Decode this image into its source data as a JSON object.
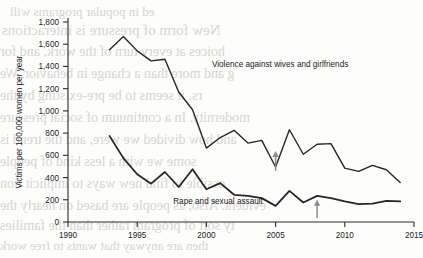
{
  "background_text": {
    "note": "faint show-through text from reverse of printed page",
    "lines": [
      {
        "text": "ed in popular programs will",
        "x": 10,
        "y": 4,
        "size": 13
      },
      {
        "text": "New form of pressure is interactions",
        "x": 2,
        "y": 22,
        "size": 15
      },
      {
        "text": "hoices at every turn of the work, and for",
        "x": 0,
        "y": 44,
        "size": 14
      },
      {
        "text": "g and more than a change in behavior. We",
        "x": 0,
        "y": 66,
        "size": 14
      },
      {
        "text": "rs, it seems to be pre-existing by the",
        "x": 0,
        "y": 88,
        "size": 14
      },
      {
        "text": "modernity. In a continuum of social pressure",
        "x": 0,
        "y": 110,
        "size": 14
      },
      {
        "text": "and how divided we were, and the trend is",
        "x": 0,
        "y": 132,
        "size": 14
      },
      {
        "text": "some we with a less kind of people",
        "x": 0,
        "y": 154,
        "size": 14
      },
      {
        "text": "ossible to find new ways to implicit tion",
        "x": 0,
        "y": 176,
        "size": 14
      },
      {
        "text": "evident. Also, as people are based on nearly the",
        "x": 0,
        "y": 198,
        "size": 14
      },
      {
        "text": "ty sort of program rather than the families",
        "x": 0,
        "y": 218,
        "size": 14
      },
      {
        "text": "then are anyway that wants to free work",
        "x": 0,
        "y": 238,
        "size": 13
      }
    ]
  },
  "chart_data": {
    "type": "line",
    "title": "",
    "xlabel": "",
    "ylabel": "Victims per 100,000 women per year",
    "xlim": [
      1990,
      2015
    ],
    "ylim": [
      0,
      1800
    ],
    "xticks": [
      1990,
      1995,
      2000,
      2005,
      2010,
      2015
    ],
    "xtick_labels": [
      "1990",
      "1995",
      "2000",
      "2005",
      "2010",
      "2015"
    ],
    "yticks": [
      0,
      200,
      400,
      600,
      800,
      1000,
      1200,
      1400,
      1600,
      1800
    ],
    "ytick_labels": [
      "0",
      "200",
      "400",
      "600",
      "800",
      "1,000",
      "1,200",
      "1,400",
      "1,600",
      "1,800"
    ],
    "grid": false,
    "legend_position": "inline-annotation",
    "line_color": "#262626",
    "series": [
      {
        "name": "Violence against wives and girlfriends",
        "label_x": 2000.4,
        "label_y": 1395,
        "x": [
          1993,
          1994,
          1995,
          1996,
          1997,
          1998,
          1999,
          2000,
          2001,
          2002,
          2003,
          2004,
          2005,
          2006,
          2007,
          2008,
          2009,
          2010,
          2011,
          2012,
          2013,
          2014
        ],
        "values": [
          1550,
          1670,
          1540,
          1450,
          1465,
          1170,
          1010,
          665,
          760,
          825,
          710,
          735,
          495,
          830,
          610,
          700,
          705,
          485,
          455,
          510,
          470,
          355
        ]
      },
      {
        "name": "Rape and sexual assault",
        "label_x": 1997.6,
        "label_y": 165,
        "x": [
          1993,
          1994,
          1995,
          1996,
          1997,
          1998,
          1999,
          2000,
          2001,
          2002,
          2003,
          2004,
          2005,
          2006,
          2007,
          2008,
          2009,
          2010,
          2011,
          2012,
          2013,
          2014
        ],
        "values": [
          775,
          575,
          430,
          345,
          450,
          315,
          475,
          295,
          350,
          245,
          235,
          215,
          145,
          280,
          175,
          235,
          215,
          185,
          160,
          165,
          190,
          185
        ]
      }
    ],
    "annotations": [
      {
        "type": "arrow",
        "name": "arrow-2005",
        "x": 2005,
        "y_tail": 460,
        "y_head": 640,
        "color": "#8c8c8c",
        "direction": "up"
      },
      {
        "type": "arrow",
        "name": "arrow-2008",
        "x": 2008,
        "y_tail": 35,
        "y_head": 200,
        "color": "#8c8c8c",
        "direction": "up"
      }
    ]
  }
}
